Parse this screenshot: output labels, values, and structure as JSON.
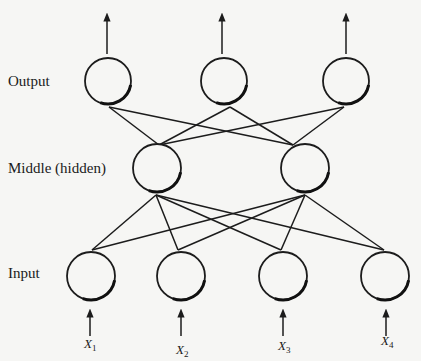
{
  "diagram": {
    "type": "neural-network",
    "layers": [
      {
        "id": "output",
        "label": "Output",
        "label_pos": [
          8,
          86
        ],
        "nodes": [
          {
            "cx": 108,
            "cy": 81,
            "r": 23
          },
          {
            "cx": 224,
            "cy": 81,
            "r": 23
          },
          {
            "cx": 346,
            "cy": 81,
            "r": 23
          }
        ]
      },
      {
        "id": "middle",
        "label": "Middle (hidden)",
        "label_pos": [
          8,
          173
        ],
        "nodes": [
          {
            "cx": 157,
            "cy": 168,
            "r": 24
          },
          {
            "cx": 305,
            "cy": 168,
            "r": 24
          }
        ]
      },
      {
        "id": "input",
        "label": "Input",
        "label_pos": [
          8,
          278
        ],
        "nodes": [
          {
            "cx": 91,
            "cy": 276,
            "r": 24
          },
          {
            "cx": 181,
            "cy": 276,
            "r": 24
          },
          {
            "cx": 283,
            "cy": 276,
            "r": 24
          },
          {
            "cx": 385,
            "cy": 276,
            "r": 24
          }
        ]
      }
    ],
    "edges": [
      {
        "from": [
          109,
          107
        ],
        "to": [
          159,
          145
        ]
      },
      {
        "from": [
          109,
          107
        ],
        "to": [
          293,
          145
        ]
      },
      {
        "from": [
          230,
          107
        ],
        "to": [
          159,
          145
        ]
      },
      {
        "from": [
          230,
          107
        ],
        "to": [
          293,
          145
        ]
      },
      {
        "from": [
          344,
          107
        ],
        "to": [
          159,
          145
        ]
      },
      {
        "from": [
          344,
          107
        ],
        "to": [
          293,
          145
        ]
      },
      {
        "from": [
          156,
          195
        ],
        "to": [
          92,
          250
        ]
      },
      {
        "from": [
          156,
          195
        ],
        "to": [
          178,
          250
        ]
      },
      {
        "from": [
          156,
          195
        ],
        "to": [
          281,
          250
        ]
      },
      {
        "from": [
          156,
          195
        ],
        "to": [
          384,
          250
        ]
      },
      {
        "from": [
          305,
          195
        ],
        "to": [
          92,
          250
        ]
      },
      {
        "from": [
          305,
          195
        ],
        "to": [
          178,
          250
        ]
      },
      {
        "from": [
          305,
          195
        ],
        "to": [
          281,
          250
        ]
      },
      {
        "from": [
          305,
          195
        ],
        "to": [
          384,
          250
        ]
      }
    ],
    "output_arrows": [
      {
        "x": 107,
        "y1": 54,
        "y2": 17
      },
      {
        "x": 222,
        "y1": 54,
        "y2": 17
      },
      {
        "x": 346,
        "y1": 54,
        "y2": 17
      }
    ],
    "input_arrows": [
      {
        "x": 90,
        "y1": 336,
        "y2": 313
      },
      {
        "x": 181,
        "y1": 336,
        "y2": 313
      },
      {
        "x": 283,
        "y1": 336,
        "y2": 313
      },
      {
        "x": 386,
        "y1": 336,
        "y2": 313
      }
    ],
    "input_labels": [
      {
        "var": "X",
        "sub": "1",
        "x": 84,
        "y": 348
      },
      {
        "var": "X",
        "sub": "2",
        "x": 176,
        "y": 354
      },
      {
        "var": "X",
        "sub": "3",
        "x": 278,
        "y": 350
      },
      {
        "var": "X",
        "sub": "4",
        "x": 381,
        "y": 345
      }
    ]
  },
  "labels": {
    "output": "Output",
    "middle": "Middle (hidden)",
    "input": "Input",
    "x1": "X",
    "x1_sub": "1",
    "x2": "X",
    "x2_sub": "2",
    "x3": "X",
    "x3_sub": "3",
    "x4": "X",
    "x4_sub": "4"
  }
}
